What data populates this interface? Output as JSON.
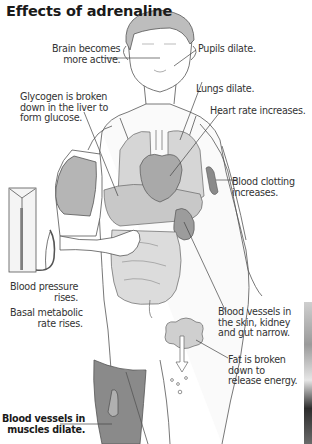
{
  "title": "Effects of adrenaline",
  "colors": {
    "title": "#1a1a1a",
    "label_text": "#333333",
    "outline": "#555555",
    "organ_fill": "#d6d6d6",
    "organ_dark": "#a9a9a9",
    "muscle_fill": "#8a8a8a",
    "hair_fill": "#bdbdbd",
    "background": "#ffffff"
  },
  "labels": {
    "brain": "Brain becomes\n more active.",
    "pupils": "Pupils dilate.",
    "glycogen": "Glycogen is broken\ndown in the liver to\nform glucose.",
    "lungs": "Lungs dilate.",
    "heart": "Heart rate increases.",
    "clotting": "Blood clotting\nincreases.",
    "blood_pressure": "Blood pressure\nrises.",
    "bmr": "Basal metabolic\nrate rises.",
    "vessels_skin": "Blood vessels in\nthe skin, kidney\nand gut narrow.",
    "fat": "Fat is broken\ndown to\nrelease energy.",
    "vessels_muscles": "Blood vessels in\nmuscles dilate."
  },
  "icons": {
    "sphygmomanometer": "blood-pressure-gauge",
    "cuff": "blood-pressure-cuff",
    "fat_arrow": "down-arrow",
    "bubbles": "energy-bubbles"
  }
}
